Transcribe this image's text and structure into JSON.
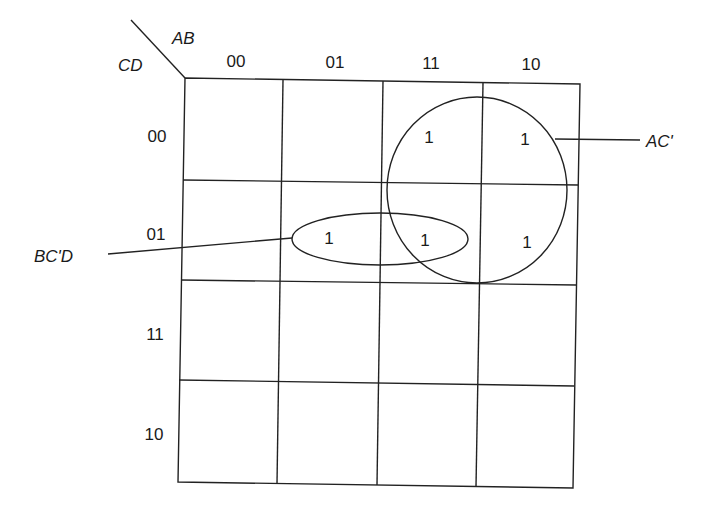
{
  "kmap": {
    "row_var_label": "CD",
    "col_var_label": "AB",
    "col_headers": [
      "00",
      "01",
      "11",
      "10"
    ],
    "row_headers": [
      "00",
      "01",
      "11",
      "10"
    ],
    "cells": [
      [
        "",
        "",
        "1",
        "1"
      ],
      [
        "",
        "1",
        "1",
        "1"
      ],
      [
        "",
        "",
        "",
        ""
      ],
      [
        "",
        "",
        "",
        ""
      ]
    ]
  },
  "groups": [
    {
      "name": "AC'",
      "label": "AC'",
      "shape": "circle",
      "covers": [
        [
          0,
          2
        ],
        [
          0,
          3
        ],
        [
          1,
          2
        ],
        [
          1,
          3
        ]
      ]
    },
    {
      "name": "BC'D",
      "label": "BC'D",
      "shape": "ellipse",
      "covers": [
        [
          1,
          1
        ],
        [
          1,
          2
        ]
      ]
    }
  ],
  "colors": {
    "line": "#222222",
    "text": "#1a1a1a",
    "background": "#ffffff"
  }
}
